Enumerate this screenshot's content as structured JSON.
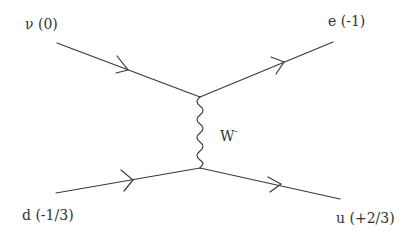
{
  "diagram": {
    "type": "feynman",
    "title": "",
    "colors": {
      "line": "#3a3a3a",
      "text": "#333333",
      "background": "#ffffff"
    },
    "particles": {
      "incoming_top": {
        "symbol": "ν",
        "charge": "(0)",
        "label": "ν (0)"
      },
      "outgoing_top": {
        "symbol": "e",
        "charge": "(-1)",
        "label": "e (-1)"
      },
      "incoming_bottom": {
        "symbol": "d",
        "charge": "(-1/3)",
        "label": "d  (-1/3)"
      },
      "outgoing_bottom": {
        "symbol": "u",
        "charge": "(+2/3)",
        "label": "u (+2/3)"
      }
    },
    "boson": {
      "symbol": "W",
      "superscript": "-",
      "label": "W-"
    },
    "vertices": [
      {
        "id": "top",
        "x": 200,
        "y": 97
      },
      {
        "id": "bottom",
        "x": 200,
        "y": 168
      }
    ],
    "edges": [
      {
        "from": [
          57,
          43
        ],
        "to": [
          200,
          97
        ],
        "kind": "fermion",
        "arrow": "forward"
      },
      {
        "from": [
          200,
          97
        ],
        "to": [
          333,
          42
        ],
        "kind": "fermion",
        "arrow": "forward"
      },
      {
        "from": [
          56,
          193
        ],
        "to": [
          200,
          168
        ],
        "kind": "fermion",
        "arrow": "forward"
      },
      {
        "from": [
          200,
          168
        ],
        "to": [
          340,
          199
        ],
        "kind": "fermion",
        "arrow": "forward"
      },
      {
        "from": [
          200,
          97
        ],
        "to": [
          200,
          168
        ],
        "kind": "boson",
        "arrow": "none"
      }
    ]
  }
}
